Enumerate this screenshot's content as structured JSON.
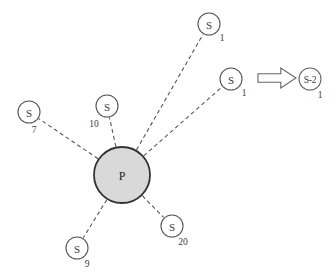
{
  "diagram": {
    "type": "star-topology-graph",
    "background_color": "#ffffff",
    "center_node": {
      "label": "P",
      "subscript": "",
      "cx": 122,
      "cy": 175,
      "r": 28,
      "fill": "#d9d9d9",
      "stroke": "#333333",
      "stroke_width": 1.8
    },
    "satellite_nodes": [
      {
        "id": "s-top",
        "label": "S",
        "subscript": "1",
        "cx": 209,
        "cy": 24,
        "r": 11,
        "sub_dx": 13,
        "sub_dy": 14
      },
      {
        "id": "s-right",
        "label": "S",
        "subscript": "1",
        "cx": 231,
        "cy": 79,
        "r": 11,
        "sub_dx": 13,
        "sub_dy": 14
      },
      {
        "id": "s-left",
        "label": "S",
        "subscript": "7",
        "cx": 29,
        "cy": 112,
        "r": 11,
        "sub_dx": 5,
        "sub_dy": 18
      },
      {
        "id": "s-upmid",
        "label": "S",
        "subscript": "10",
        "cx": 107,
        "cy": 106,
        "r": 11,
        "sub_dx": -13,
        "sub_dy": 18
      },
      {
        "id": "s-botleft",
        "label": "S",
        "subscript": "9",
        "cx": 77,
        "cy": 248,
        "r": 11,
        "sub_dx": 10,
        "sub_dy": 16
      },
      {
        "id": "s-botright",
        "label": "S",
        "subscript": "20",
        "cx": 172,
        "cy": 226,
        "r": 11,
        "sub_dx": 11,
        "sub_dy": 16
      }
    ],
    "edges": [
      {
        "id": "edge-top",
        "from": "center",
        "to": "s-top"
      },
      {
        "id": "edge-right",
        "from": "center",
        "to": "s-right"
      },
      {
        "id": "edge-left",
        "from": "center",
        "to": "s-left"
      },
      {
        "id": "edge-upmid",
        "from": "center",
        "to": "s-upmid"
      },
      {
        "id": "edge-botleft",
        "from": "center",
        "to": "s-botleft"
      },
      {
        "id": "edge-botright",
        "from": "center",
        "to": "s-botright"
      }
    ],
    "edge_style": {
      "stroke": "#555555",
      "stroke_width": 1.1,
      "dash_array": "4 3"
    },
    "node_style": {
      "fill": "#ffffff",
      "stroke": "#555555",
      "stroke_width": 1.1
    },
    "arrow": {
      "name": "transform-arrow",
      "x": 258,
      "y": 68,
      "width": 38,
      "height": 20,
      "fill": "#ffffff",
      "stroke": "#666666"
    },
    "result_node": {
      "label": "S-2",
      "subscript": "1",
      "cx": 310,
      "cy": 79,
      "r": 11,
      "sub_dx": 10,
      "sub_dy": 16,
      "fill": "#ffffff",
      "stroke": "#666666"
    }
  }
}
